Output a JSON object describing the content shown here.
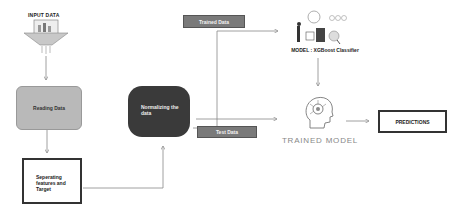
{
  "diagram": {
    "input": {
      "label": "INPUT DATA",
      "icon": "data-funnel-icon"
    },
    "reading": {
      "label": "Reading Data"
    },
    "separating": {
      "label": "Seperating features and Target"
    },
    "normalizing": {
      "label": "Normalizing the data"
    },
    "trained_data": {
      "label": "Trained Data"
    },
    "test_data": {
      "label": "Test Data"
    },
    "model": {
      "label": "MODEL :  XGBoost Classifier",
      "icon": "ml-model-illustration-icon"
    },
    "trained_model": {
      "label": "TRAINED MODEL",
      "icon": "brain-head-icon"
    },
    "predictions": {
      "label": "PREDICTIONS"
    }
  },
  "colors": {
    "reading_fill": "#b9b9b9",
    "normalizing_fill": "#3a3a3a",
    "tag_fill": "#7a7a7a",
    "line": "#888888"
  }
}
